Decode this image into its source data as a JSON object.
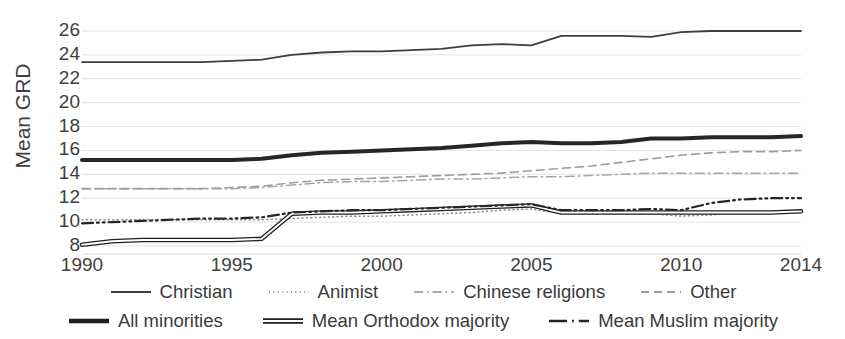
{
  "chart_data": {
    "type": "line",
    "title": "",
    "xlabel": "",
    "ylabel": "Mean GRD",
    "xlim": [
      1990,
      2014
    ],
    "ylim": [
      7,
      27
    ],
    "yticks": [
      8,
      10,
      12,
      14,
      16,
      18,
      20,
      22,
      24,
      26
    ],
    "xticks": [
      1990,
      1995,
      2000,
      2005,
      2010,
      2014
    ],
    "xtick_labels": [
      "1990",
      "1995",
      "2000",
      "2005",
      "2010",
      "2014"
    ],
    "grid": true,
    "grid_axis": "y",
    "legend_position": "bottom",
    "x": [
      1990,
      1991,
      1992,
      1993,
      1994,
      1995,
      1996,
      1997,
      1998,
      1999,
      2000,
      2001,
      2002,
      2003,
      2004,
      2005,
      2006,
      2007,
      2008,
      2009,
      2010,
      2011,
      2012,
      2013,
      2014
    ],
    "series": [
      {
        "name": "Christian",
        "style": "solid",
        "width": 1.8,
        "color": "#3f3f3f",
        "values": [
          23.4,
          23.4,
          23.4,
          23.4,
          23.4,
          23.5,
          23.6,
          24.0,
          24.2,
          24.3,
          24.3,
          24.4,
          24.5,
          24.8,
          24.9,
          24.8,
          25.6,
          25.6,
          25.6,
          25.5,
          25.9,
          26.0,
          26.0,
          26.0,
          26.0
        ]
      },
      {
        "name": "Animist",
        "style": "dotted",
        "width": 1.5,
        "color": "#8a8a8a",
        "values": [
          10.2,
          10.2,
          10.2,
          10.2,
          10.2,
          10.2,
          10.2,
          10.3,
          10.4,
          10.5,
          10.5,
          10.6,
          10.7,
          10.8,
          11.0,
          11.1,
          10.7,
          10.7,
          10.7,
          10.7,
          10.5,
          10.6,
          10.8,
          10.8,
          10.8
        ]
      },
      {
        "name": "Chinese religions",
        "style": "dashdot",
        "width": 1.5,
        "color": "#a5a5a5",
        "values": [
          12.8,
          12.8,
          12.8,
          12.8,
          12.8,
          12.8,
          12.9,
          13.1,
          13.3,
          13.4,
          13.4,
          13.5,
          13.6,
          13.6,
          13.7,
          13.8,
          13.8,
          13.9,
          14.0,
          14.1,
          14.1,
          14.1,
          14.1,
          14.1,
          14.1
        ]
      },
      {
        "name": "Other",
        "style": "dashed",
        "width": 1.6,
        "color": "#9e9e9e",
        "values": [
          12.8,
          12.8,
          12.8,
          12.8,
          12.8,
          12.9,
          13.0,
          13.3,
          13.5,
          13.6,
          13.7,
          13.8,
          13.9,
          14.0,
          14.1,
          14.3,
          14.5,
          14.7,
          15.0,
          15.3,
          15.6,
          15.8,
          15.9,
          15.9,
          16.0
        ]
      },
      {
        "name": "All minorities",
        "style": "solid",
        "width": 4.0,
        "color": "#262626",
        "values": [
          15.2,
          15.2,
          15.2,
          15.2,
          15.2,
          15.2,
          15.3,
          15.6,
          15.8,
          15.9,
          16.0,
          16.1,
          16.2,
          16.4,
          16.6,
          16.7,
          16.6,
          16.6,
          16.7,
          17.0,
          17.0,
          17.1,
          17.1,
          17.1,
          17.2
        ]
      },
      {
        "name": "Mean Orthodox majority",
        "style": "double",
        "width": 4.5,
        "color": "#1f1f1f",
        "values": [
          8.1,
          8.4,
          8.5,
          8.5,
          8.5,
          8.5,
          8.6,
          10.7,
          10.8,
          10.8,
          10.9,
          11.0,
          11.1,
          11.2,
          11.3,
          11.4,
          10.8,
          10.8,
          10.8,
          10.8,
          10.8,
          10.8,
          10.8,
          10.8,
          10.9
        ]
      },
      {
        "name": "Mean Muslim majority",
        "style": "dashdotdot",
        "width": 2.2,
        "color": "#262626",
        "values": [
          9.9,
          10.0,
          10.1,
          10.2,
          10.3,
          10.3,
          10.4,
          10.8,
          10.9,
          11.0,
          11.0,
          11.1,
          11.2,
          11.3,
          11.4,
          11.5,
          11.0,
          11.0,
          11.0,
          11.1,
          11.0,
          11.6,
          11.9,
          12.0,
          12.0
        ]
      }
    ]
  },
  "axis": {
    "y_title": "Mean GRD",
    "y_tick_labels": [
      "26",
      "24",
      "22",
      "20",
      "18",
      "16",
      "14",
      "12",
      "10",
      "8"
    ],
    "x_tick_labels": [
      "1990",
      "1995",
      "2000",
      "2005",
      "2010",
      "2014"
    ]
  },
  "legend": {
    "row1": [
      {
        "label": "Christian",
        "style": "solid"
      },
      {
        "label": "Animist",
        "style": "dotted"
      },
      {
        "label": "Chinese religions",
        "style": "dashdot"
      },
      {
        "label": "Other",
        "style": "dashed"
      }
    ],
    "row2": [
      {
        "label": "All minorities",
        "style": "solid-thick"
      },
      {
        "label": "Mean Orthodox majority",
        "style": "double-thick"
      },
      {
        "label": "Mean Muslim majority",
        "style": "dashdot-thick"
      }
    ]
  },
  "colors": {
    "axis_text": "#404040",
    "gridline": "#e3e3e3",
    "plot_background": "#ffffff"
  }
}
